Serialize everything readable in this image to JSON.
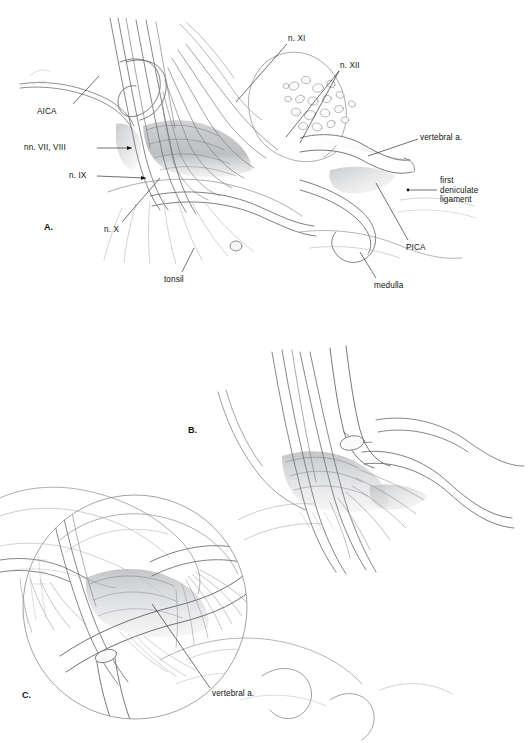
{
  "figure": {
    "background_color": "#ffffff",
    "ink_color": "#111111",
    "pencil_color": "#6f7175",
    "shade_color": "#9a9ca0",
    "panels": [
      {
        "id": "A",
        "letter": "A.",
        "x": 44,
        "y": 222
      },
      {
        "id": "B",
        "letter": "B.",
        "x": 188,
        "y": 425
      },
      {
        "id": "C",
        "letter": "C.",
        "x": 22,
        "y": 690
      }
    ],
    "labels": [
      {
        "id": "aica",
        "text": "AICA",
        "panel": "A",
        "x": 37,
        "y": 107,
        "align": "left",
        "leader": {
          "x1": 73,
          "y1": 107,
          "x2": 99,
          "y2": 76
        }
      },
      {
        "id": "nn-vii-viii",
        "text": "nn. VII, VIII",
        "panel": "A",
        "x": 24,
        "y": 145,
        "align": "left",
        "leader": {
          "x1": 97,
          "y1": 150,
          "x2": 130,
          "y2": 150
        }
      },
      {
        "id": "n-ix",
        "text": "n. IX",
        "panel": "A",
        "x": 69,
        "y": 173,
        "align": "left",
        "leader": {
          "x1": 97,
          "y1": 178,
          "x2": 144,
          "y2": 180
        }
      },
      {
        "id": "n-x",
        "text": "n. X",
        "panel": "A",
        "x": 104,
        "y": 227,
        "align": "left",
        "leader": {
          "x1": 122,
          "y1": 226,
          "x2": 160,
          "y2": 180
        }
      },
      {
        "id": "tonsil",
        "text": "tonsil",
        "panel": "A",
        "x": 164,
        "y": 277,
        "align": "left",
        "leader": {
          "x1": 182,
          "y1": 275,
          "x2": 194,
          "y2": 248
        }
      },
      {
        "id": "n-xi",
        "text": "n. XI",
        "panel": "A",
        "x": 288,
        "y": 36,
        "align": "left",
        "leader": {
          "x1": 287,
          "y1": 45,
          "x2": 235,
          "y2": 102
        }
      },
      {
        "id": "n-xii",
        "text": "n. XII",
        "panel": "A",
        "x": 340,
        "y": 63,
        "align": "left",
        "leader": {
          "x1": 339,
          "y1": 72,
          "x2": 288,
          "y2": 137
        }
      },
      {
        "id": "vertebral-a-A",
        "text": "vertebral a.",
        "panel": "A",
        "x": 420,
        "y": 135,
        "align": "left",
        "leader": {
          "x1": 419,
          "y1": 141,
          "x2": 369,
          "y2": 157
        }
      },
      {
        "id": "first-deniculate-ligament",
        "text": "first\ndeniculate\nligament",
        "panel": "A",
        "x": 440,
        "y": 179,
        "align": "left",
        "leader": {
          "x1": 437,
          "y1": 192,
          "x2": 410,
          "y2": 192
        }
      },
      {
        "id": "pica",
        "text": "PICA",
        "panel": "A",
        "x": 406,
        "y": 244,
        "align": "left",
        "leader": {
          "x1": 409,
          "y1": 243,
          "x2": 375,
          "y2": 183
        }
      },
      {
        "id": "medulla",
        "text": "medulla",
        "panel": "A",
        "x": 374,
        "y": 282,
        "align": "left",
        "leader": {
          "x1": 375,
          "y1": 281,
          "x2": 360,
          "y2": 254
        }
      },
      {
        "id": "vertebral-a-C",
        "text": "vertebral a.",
        "panel": "C",
        "x": 212,
        "y": 690,
        "align": "left",
        "leader": {
          "x1": 211,
          "y1": 690,
          "x2": 152,
          "y2": 604
        }
      }
    ],
    "anatomy_terms": [
      "AICA",
      "nn. VII, VIII",
      "n. IX",
      "n. X",
      "n. XI",
      "n. XII",
      "tonsil",
      "medulla",
      "PICA",
      "vertebral a.",
      "first deniculate ligament"
    ]
  }
}
